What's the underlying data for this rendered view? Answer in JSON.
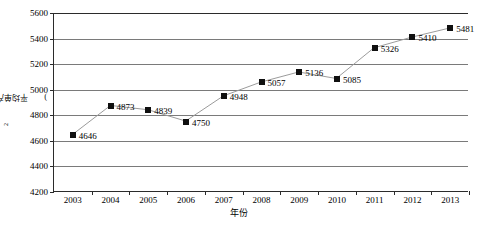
{
  "chart_data": {
    "type": "line",
    "title": "",
    "xlabel": "年份",
    "ylabel_parts": {
      "prefix": "平均单产/(kg/hm",
      "sup": "2",
      "suffix": ")"
    },
    "ylabel": "平均单产/(kg/hm2)",
    "categories": [
      "2003",
      "2004",
      "2005",
      "2006",
      "2007",
      "2008",
      "2009",
      "2010",
      "2011",
      "2012",
      "2013"
    ],
    "values": [
      4646,
      4873,
      4839,
      4750,
      4948,
      5057,
      5136,
      5085,
      5326,
      5410,
      5481
    ],
    "point_labels": [
      "4646",
      "4873",
      "4839",
      "4750",
      "4948",
      "5057",
      "5136",
      "5085",
      "5326",
      "5410",
      "5481"
    ],
    "ylim": [
      4200,
      5600
    ],
    "yticks": [
      4200,
      4400,
      4600,
      4800,
      5000,
      5200,
      5400,
      5600
    ],
    "ytick_labels": [
      "4200",
      "4400",
      "4600",
      "4800",
      "5000",
      "5200",
      "5400",
      "5600"
    ],
    "grid": true,
    "legend": false,
    "marker": "square",
    "marker_color": "#101010",
    "line_color": "#9a9a9a",
    "grid_color": "#7a7a7a",
    "axis_color": "#2b2b2b",
    "background": "#ffffff"
  }
}
